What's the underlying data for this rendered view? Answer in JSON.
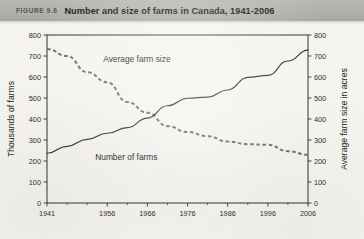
{
  "figure": {
    "number_label": "FIGURE 9.6",
    "title": "Number and size of farms in Canada, 1941-2006",
    "band_color": "#b2b0ab",
    "page_background": "#f4f3ef"
  },
  "chart_data": {
    "type": "line",
    "title": "Number and size of farms in Canada, 1941-2006",
    "xlabel": "",
    "ylabel": "Thousands of farms",
    "y2label": "Average farm size in acres",
    "xlim": [
      1941,
      2006
    ],
    "ylim": [
      0,
      800
    ],
    "y2lim": [
      0,
      800
    ],
    "grid": false,
    "legend": "inline-annotations",
    "xticks": [
      1941,
      1956,
      1966,
      1976,
      1986,
      1996,
      2006
    ],
    "xtick_labels": [
      "1941",
      "1956",
      "1966",
      "1976",
      "1986",
      "1996",
      "2006"
    ],
    "xminor_ticks": [
      1946,
      1951,
      1961,
      1971,
      1981,
      1991,
      2001
    ],
    "yticks": [
      0,
      100,
      200,
      300,
      400,
      500,
      600,
      700,
      800
    ],
    "ytick_labels": [
      "0",
      "100",
      "200",
      "300",
      "400",
      "500",
      "600",
      "700",
      "800"
    ],
    "y2ticks": [
      0,
      100,
      200,
      300,
      400,
      500,
      600,
      700,
      800
    ],
    "y2tick_labels": [
      "0",
      "100",
      "200",
      "300",
      "400",
      "500",
      "600",
      "700",
      "800"
    ],
    "series": [
      {
        "name": "Average farm size",
        "label": "Average farm size",
        "style": "dashed",
        "color": "#6e6c69",
        "axis": "left",
        "x": [
          1941,
          1946,
          1951,
          1956,
          1961,
          1966,
          1971,
          1976,
          1981,
          1986,
          1991,
          1996,
          2001,
          2006
        ],
        "values": [
          733,
          700,
          623,
          575,
          481,
          430,
          366,
          338,
          318,
          293,
          280,
          277,
          247,
          230
        ]
      },
      {
        "name": "Number of farms",
        "label": "Number of farms",
        "style": "solid",
        "color": "#2a2927",
        "axis": "right",
        "x": [
          1941,
          1946,
          1951,
          1956,
          1961,
          1966,
          1971,
          1976,
          1981,
          1986,
          1991,
          1996,
          2001,
          2006
        ],
        "values": [
          237,
          270,
          303,
          332,
          359,
          404,
          463,
          499,
          504,
          538,
          598,
          608,
          676,
          728
        ]
      }
    ],
    "annotations": [
      {
        "text": "Average farm size",
        "x": 1955,
        "y": 672
      },
      {
        "text": "Number of farms",
        "x": 1953,
        "y": 205
      }
    ]
  }
}
